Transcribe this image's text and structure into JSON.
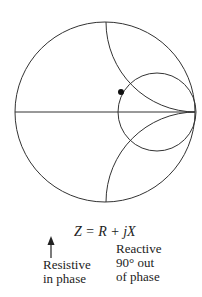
{
  "diagram": {
    "type": "smith-chart",
    "outer_circle": {
      "cx": 105,
      "cy": 112,
      "r": 90
    },
    "resistance_circle": {
      "cx": 157,
      "cy": 112,
      "r": 39
    },
    "reactance_arcs": [
      {
        "cx": 196,
        "cy": 22,
        "r": 90
      },
      {
        "cx": 196,
        "cy": 202,
        "r": 90
      }
    ],
    "point": {
      "cx": 121,
      "cy": 92,
      "r": 3
    },
    "stroke_color": "#333333"
  },
  "labels": {
    "equation": "Z = R + jX",
    "resistive": [
      "Resistive",
      "in phase"
    ],
    "reactive": [
      "Reactive",
      "90° out",
      "of phase"
    ]
  }
}
